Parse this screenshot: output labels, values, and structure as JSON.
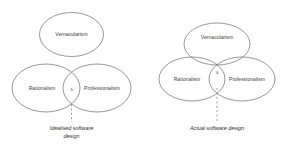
{
  "figure": {
    "background_color": "#fefefe",
    "stroke_color": "#6b6b6b",
    "dash_color": "#8c8c8c",
    "text_color": "#3f3f3f"
  },
  "diagrams": [
    {
      "id": "idealised",
      "caption_line1": "Idealised software",
      "caption_line2": "design",
      "caption_full": "Idealised software design",
      "marker": "Δ",
      "sets": [
        {
          "key": "vernacularism",
          "label": "Vernacularism"
        },
        {
          "key": "rationalism",
          "label": "Rationalism"
        },
        {
          "key": "professionalism",
          "label": "Professionalism"
        }
      ]
    },
    {
      "id": "actual",
      "caption_line1": "Actual software design",
      "caption_line2": "",
      "caption_full": "Actual software design",
      "marker": "Δ",
      "sets": [
        {
          "key": "vernacularism",
          "label": "Vernacularism"
        },
        {
          "key": "rationalism",
          "label": "Rationalism"
        },
        {
          "key": "professionalism",
          "label": "Professionalism"
        }
      ]
    }
  ]
}
